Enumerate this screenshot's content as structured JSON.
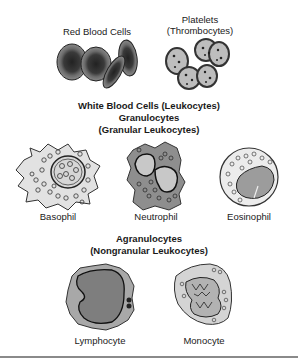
{
  "top_row": {
    "red_blood_cells": {
      "label": "Red Blood Cells"
    },
    "platelets": {
      "label_line1": "Platelets",
      "label_line2": "(Thrombocytes)"
    }
  },
  "white_blood_cells": {
    "title": "White Blood Cells (Leukocytes)",
    "granulocytes": {
      "title": "Granulocytes",
      "subtitle": "(Granular Leukocytes)",
      "cells": [
        {
          "label": "Basophil"
        },
        {
          "label": "Neutrophil"
        },
        {
          "label": "Eosinophil"
        }
      ]
    },
    "agranulocytes": {
      "title": "Agranulocytes",
      "subtitle": "(Nongranular Leukocytes)",
      "cells": [
        {
          "label": "Lymphocyte"
        },
        {
          "label": "Monocyte"
        }
      ]
    }
  },
  "colors": {
    "rbc_outer": "#7a7a7a",
    "rbc_center": "#2a2a2a",
    "platelet_fill": "#b8b8b8",
    "cytoplasm_light": "#dcdcdc",
    "cytoplasm_dark": "#8c8c8c",
    "nucleus": "#9a9a9a",
    "divider": "#8a8a8a"
  }
}
